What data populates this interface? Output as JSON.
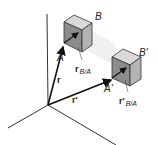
{
  "diagram": {
    "type": "rigid-body-translation",
    "points": {
      "A": "A",
      "B": "B",
      "A_prime": "A'",
      "B_prime": "B'"
    },
    "vectors": {
      "r": "r",
      "r_prime": "r'",
      "r_BA": "r",
      "r_BA_sub": "B/A",
      "r_BA_prime": "r'",
      "r_BA_prime_sub": "B/A"
    },
    "colors": {
      "axis": "#333333",
      "vector": "#111111",
      "cube_top": "#d9d9d9",
      "cube_left": "#8c8c8c",
      "cube_right": "#b3b3b3",
      "ghost": "#eeeeee"
    }
  }
}
